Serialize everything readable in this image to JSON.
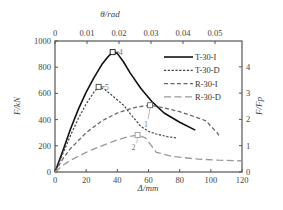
{
  "chart_data": {
    "type": "line",
    "title": "",
    "xlabel": "Δ/mm",
    "ylabel": "F/kN",
    "x2label": "θ/rad",
    "y2label": "F/F_p",
    "xlim": [
      0,
      120
    ],
    "ylim": [
      0,
      1000
    ],
    "x2lim": [
      0,
      0.0585
    ],
    "y2lim": [
      0,
      5
    ],
    "x_ticks": [
      "0",
      "20",
      "40",
      "60",
      "80",
      "100",
      "120"
    ],
    "y_ticks": [
      "0",
      "200",
      "400",
      "600",
      "800",
      "1000"
    ],
    "x2_ticks": [
      "0",
      "0.01",
      "0.02",
      "0.03",
      "0.04",
      "0.05"
    ],
    "y2_ticks": [
      "0",
      "1",
      "2",
      "3",
      "4"
    ],
    "grid": false,
    "legend_position": "upper right",
    "series": [
      {
        "name": "T-30-I",
        "style": "solid",
        "color": "#111111",
        "x": [
          0,
          5,
          10,
          15,
          20,
          25,
          30,
          34,
          37,
          40,
          44,
          48,
          55,
          62,
          70,
          80,
          90
        ],
        "y": [
          0,
          160,
          330,
          480,
          610,
          720,
          820,
          880,
          915,
          905,
          840,
          760,
          640,
          540,
          450,
          380,
          320
        ],
        "peak": {
          "x": 37,
          "y": 915,
          "label": "4"
        }
      },
      {
        "name": "T-30-D",
        "style": "dotted-dash",
        "color": "#444444",
        "x": [
          0,
          5,
          10,
          15,
          20,
          25,
          28,
          32,
          38,
          44,
          50,
          55,
          60,
          65,
          72,
          78
        ],
        "y": [
          0,
          140,
          280,
          410,
          520,
          610,
          650,
          630,
          570,
          510,
          420,
          350,
          310,
          290,
          270,
          260
        ],
        "peak": {
          "x": 28,
          "y": 650,
          "label": "5"
        }
      },
      {
        "name": "R-30-I",
        "style": "dashed",
        "color": "#666666",
        "x": [
          0,
          5,
          10,
          20,
          30,
          40,
          50,
          55,
          61,
          70,
          80,
          90,
          97,
          100,
          104,
          106
        ],
        "y": [
          0,
          100,
          180,
          300,
          390,
          450,
          490,
          500,
          510,
          490,
          460,
          420,
          390,
          350,
          300,
          265
        ],
        "peak": {
          "x": 61,
          "y": 510,
          "label": "1"
        }
      },
      {
        "name": "R-30-D",
        "style": "long-dash",
        "color": "#999999",
        "x": [
          0,
          5,
          10,
          20,
          30,
          40,
          47,
          53,
          58,
          62,
          65,
          75,
          90,
          105,
          120
        ],
        "y": [
          0,
          50,
          90,
          150,
          200,
          245,
          270,
          282,
          260,
          200,
          150,
          120,
          100,
          90,
          85
        ],
        "peak": {
          "x": 53,
          "y": 282,
          "label": "2"
        }
      }
    ],
    "annotations": [
      {
        "text": "4",
        "near": "T-30-I peak"
      },
      {
        "text": "5",
        "near": "T-30-D peak"
      },
      {
        "text": "1",
        "near": "R-30-I peak"
      },
      {
        "text": "2",
        "near": "R-30-D peak"
      }
    ]
  },
  "labels": {
    "xlabel": "Δ/mm",
    "ylabel": "F/kN",
    "x2label": "θ/rad",
    "y2label": "F/Fp",
    "legend": [
      "T-30-I",
      "T-30-D",
      "R-30-I",
      "R-30-D"
    ]
  }
}
